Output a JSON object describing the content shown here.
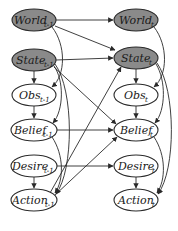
{
  "diagram": {
    "type": "dynamic-bayesian-network",
    "nodes": [
      {
        "id": "world_prev",
        "label": "World",
        "sub": "t-1",
        "shaded": true,
        "cx": 34,
        "cy": 20
      },
      {
        "id": "state_prev",
        "label": "State",
        "sub": "t-1",
        "shaded": true,
        "cx": 34,
        "cy": 60
      },
      {
        "id": "obs_prev",
        "label": "Obs",
        "sub": "t-1",
        "shaded": false,
        "cx": 34,
        "cy": 95
      },
      {
        "id": "belief_prev",
        "label": "Belief",
        "sub": "t-1",
        "shaded": false,
        "cx": 34,
        "cy": 130
      },
      {
        "id": "desire_prev",
        "label": "Desire",
        "sub": "t-1",
        "shaded": false,
        "cx": 34,
        "cy": 166
      },
      {
        "id": "action_prev",
        "label": "Action",
        "sub": "t-1",
        "shaded": false,
        "cx": 34,
        "cy": 200
      },
      {
        "id": "world_t",
        "label": "World",
        "sub": "t",
        "shaded": true,
        "cx": 136,
        "cy": 20
      },
      {
        "id": "state_t",
        "label": "State",
        "sub": "t",
        "shaded": true,
        "cx": 136,
        "cy": 58
      },
      {
        "id": "obs_t",
        "label": "Obs",
        "sub": "t",
        "shaded": false,
        "cx": 136,
        "cy": 95
      },
      {
        "id": "belief_t",
        "label": "Belief",
        "sub": "t",
        "shaded": false,
        "cx": 136,
        "cy": 130
      },
      {
        "id": "desire_t",
        "label": "Desire",
        "sub": "t",
        "shaded": false,
        "cx": 136,
        "cy": 166
      },
      {
        "id": "action_t",
        "label": "Action",
        "sub": "t",
        "shaded": false,
        "cx": 136,
        "cy": 200
      }
    ],
    "edges": [
      [
        "world_prev",
        "world_t"
      ],
      [
        "world_prev",
        "state_t"
      ],
      [
        "world_prev",
        "obs_prev"
      ],
      [
        "state_prev",
        "state_t"
      ],
      [
        "state_prev",
        "obs_prev"
      ],
      [
        "state_prev",
        "belief_prev"
      ],
      [
        "state_prev",
        "action_prev"
      ],
      [
        "state_prev",
        "belief_t"
      ],
      [
        "obs_prev",
        "belief_prev"
      ],
      [
        "belief_prev",
        "belief_t"
      ],
      [
        "belief_prev",
        "action_prev"
      ],
      [
        "desire_prev",
        "desire_t"
      ],
      [
        "desire_prev",
        "action_prev"
      ],
      [
        "action_prev",
        "state_t"
      ],
      [
        "action_prev",
        "belief_t"
      ],
      [
        "world_t",
        "obs_t"
      ],
      [
        "state_t",
        "obs_t"
      ],
      [
        "state_t",
        "belief_t"
      ],
      [
        "state_t",
        "action_t"
      ],
      [
        "obs_t",
        "belief_t"
      ],
      [
        "belief_t",
        "action_t"
      ],
      [
        "desire_t",
        "action_t"
      ]
    ]
  }
}
